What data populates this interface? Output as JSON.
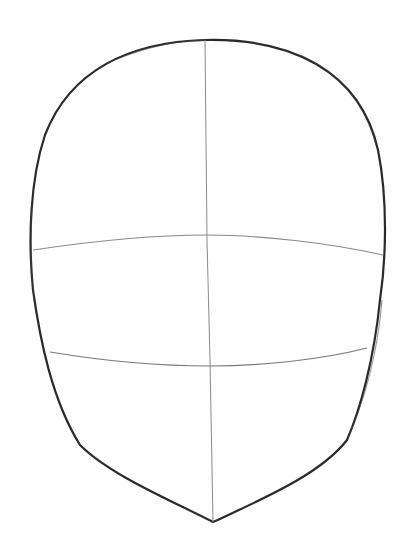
{
  "image": {
    "subject": "Pencil sketch of a head outline with construction guide lines",
    "background_color": "#fefefe",
    "stroke_color": "#2a2a2a",
    "guide_color": "#8a8a8a",
    "elements": [
      {
        "name": "head-outline",
        "description": "Oval cranium tapering to a pointed chin"
      },
      {
        "name": "vertical-center-line",
        "description": "Vertical midline from crown to chin"
      },
      {
        "name": "eye-line",
        "description": "Horizontal guide arcing slightly upward across the middle"
      },
      {
        "name": "nose-line",
        "description": "Horizontal guide arcing slightly downward in the lower third"
      }
    ]
  }
}
